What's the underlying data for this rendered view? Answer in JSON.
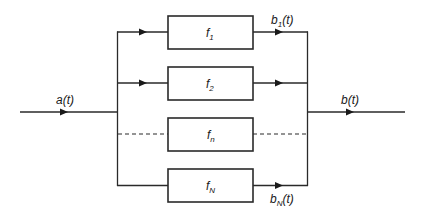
{
  "diagram": {
    "type": "parallel filter bank block diagram",
    "input": {
      "label_main": "a",
      "label_arg": "(t)"
    },
    "output": {
      "label_main": "b",
      "label_arg": "(t)"
    },
    "branches": [
      {
        "box_main": "f",
        "box_sub": "1",
        "line_style": "solid",
        "out_label_main": "b",
        "out_label_sub": "1",
        "out_label_arg": "(t)"
      },
      {
        "box_main": "f",
        "box_sub": "2",
        "line_style": "solid",
        "out_label_main": "",
        "out_label_sub": "",
        "out_label_arg": ""
      },
      {
        "box_main": "f",
        "box_sub": "n",
        "line_style": "dashed",
        "out_label_main": "",
        "out_label_sub": "",
        "out_label_arg": ""
      },
      {
        "box_main": "f",
        "box_sub": "N",
        "line_style": "solid",
        "out_label_main": "b",
        "out_label_sub": "N",
        "out_label_arg": "(t)"
      }
    ]
  }
}
